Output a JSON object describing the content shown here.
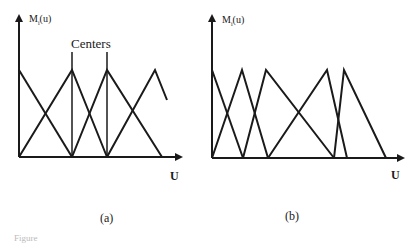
{
  "diagram_a": {
    "y_label_main": "M",
    "y_label_sub": "i",
    "y_label_rest": "(u)",
    "centers_label": "Centers",
    "x_label": "U",
    "caption": "(a)",
    "description": "Evenly spaced triangular membership functions with marked centers"
  },
  "diagram_b": {
    "y_label_main": "M",
    "y_label_sub": "i",
    "y_label_rest": "(u)",
    "x_label": "U",
    "caption": "(b)",
    "description": "Unevenly spaced triangular membership functions"
  },
  "figure_caption": "Figure",
  "colors": {
    "line": "#1a1a1a",
    "background": "#ffffff"
  }
}
